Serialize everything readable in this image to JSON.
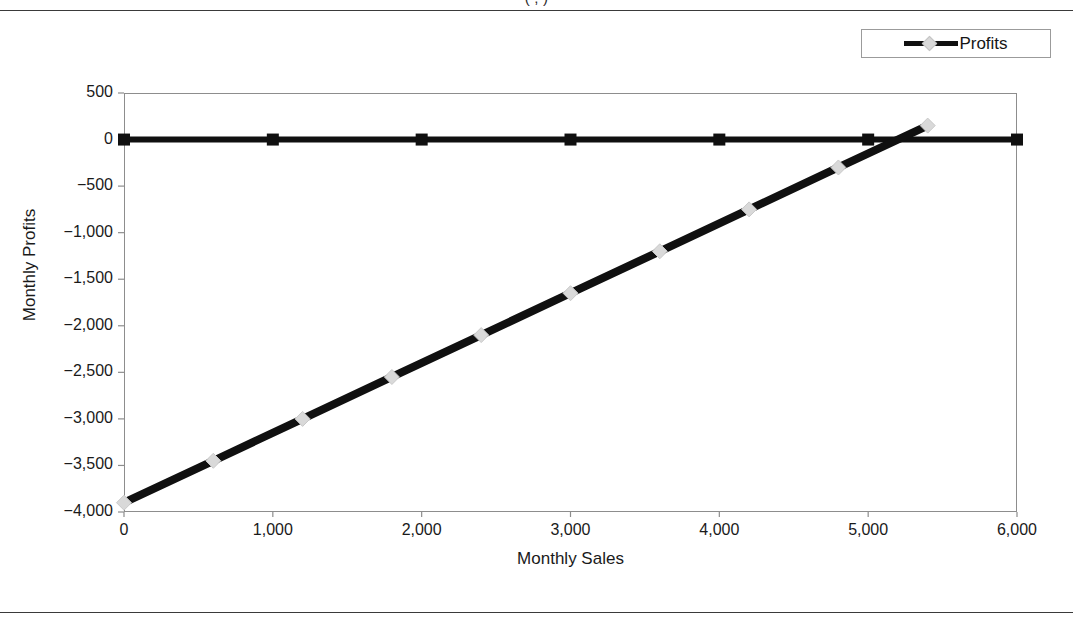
{
  "page": {
    "figure_title": "(                ,           )"
  },
  "legend": {
    "position": "top-right",
    "entries": [
      {
        "label": "Profits",
        "line_color": "#101010",
        "marker_color": "#d9d9d9",
        "marker": "diamond"
      }
    ]
  },
  "chart_data": {
    "type": "line",
    "title": "",
    "xlabel": "Monthly Sales",
    "ylabel": "Monthly Profits",
    "xlim": [
      0,
      6000
    ],
    "ylim": [
      -4000,
      500
    ],
    "xticks": [
      0,
      1000,
      2000,
      3000,
      4000,
      5000,
      6000
    ],
    "xticklabels": [
      "0",
      "1,000",
      "2,000",
      "3,000",
      "4,000",
      "5,000",
      "6,000"
    ],
    "yticks": [
      500,
      0,
      -500,
      -1000,
      -1500,
      -2000,
      -2500,
      -3000,
      -3500,
      -4000
    ],
    "yticklabels": [
      "500",
      "0",
      "-500",
      "-1,000",
      "-1,500",
      "-2,000",
      "-2,500",
      "-3,000",
      "-3,500",
      "-4,000"
    ],
    "grid": false,
    "legend_position": "top-right",
    "series": [
      {
        "name": "Zero Line",
        "marker": "square",
        "line_color": "#101010",
        "marker_color": "#101010",
        "x": [
          0,
          1000,
          2000,
          3000,
          4000,
          5000,
          6000
        ],
        "values": [
          0,
          0,
          0,
          0,
          0,
          0,
          0
        ]
      },
      {
        "name": "Profits",
        "marker": "diamond",
        "line_color": "#101010",
        "marker_color": "#d9d9d9",
        "x": [
          0,
          600,
          1200,
          1800,
          2400,
          3000,
          3600,
          4200,
          4800,
          5400
        ],
        "values": [
          -3900,
          -3450,
          -3000,
          -2550,
          -2100,
          -1650,
          -1200,
          -750,
          -300,
          150
        ]
      }
    ]
  }
}
